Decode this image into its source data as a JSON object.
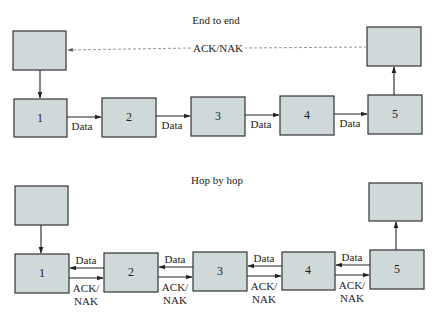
{
  "diagram": {
    "colors": {
      "box_fill": "#cfd9d9",
      "box_stroke": "#333333",
      "arrow": "#222222",
      "dashed_arrow": "#8a8a8a"
    },
    "end_to_end": {
      "title": "End to end",
      "ack_label": "ACK/NAK",
      "source_box_label": "",
      "dest_box_label": "",
      "nodes": [
        {
          "label": "1"
        },
        {
          "label": "2"
        },
        {
          "label": "3"
        },
        {
          "label": "4"
        },
        {
          "label": "5"
        }
      ],
      "links": [
        {
          "label": "Data",
          "direction": "right"
        },
        {
          "label": "Data",
          "direction": "right"
        },
        {
          "label": "Data",
          "direction": "right"
        },
        {
          "label": "Data",
          "direction": "right"
        }
      ]
    },
    "hop_by_hop": {
      "title": "Hop by hop",
      "source_box_label": "",
      "dest_box_label": "",
      "nodes": [
        {
          "label": "1"
        },
        {
          "label": "2"
        },
        {
          "label": "3"
        },
        {
          "label": "4"
        },
        {
          "label": "5"
        }
      ],
      "links": [
        {
          "data_label": "Data",
          "data_direction": "left",
          "ack_label_line1": "ACK/",
          "ack_label_line2": "NAK",
          "ack_direction": "right"
        },
        {
          "data_label": "Data",
          "data_direction": "left",
          "ack_label_line1": "ACK/",
          "ack_label_line2": "NAK",
          "ack_direction": "right"
        },
        {
          "data_label": "Data",
          "data_direction": "left",
          "ack_label_line1": "ACK/",
          "ack_label_line2": "NAK",
          "ack_direction": "right"
        },
        {
          "data_label": "Data",
          "data_direction": "left",
          "ack_label_line1": "ACK/",
          "ack_label_line2": "NAK",
          "ack_direction": "right"
        }
      ]
    }
  }
}
